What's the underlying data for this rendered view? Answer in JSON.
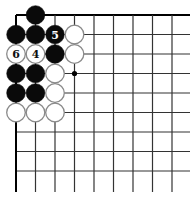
{
  "diagram": {
    "type": "go-board-corner",
    "grid": {
      "cols": 9,
      "rows": 9,
      "origin_x": 16,
      "origin_y": 15,
      "spacing": 19.5,
      "extend_right": 190,
      "extend_bottom": 192,
      "line_color": "#333333",
      "edge_color": "#000000"
    },
    "star_points": [
      {
        "col": 3,
        "row": 3
      }
    ],
    "stones": [
      {
        "col": 1,
        "row": 0,
        "color": "black",
        "label": ""
      },
      {
        "col": 0,
        "row": 1,
        "color": "black",
        "label": ""
      },
      {
        "col": 1,
        "row": 1,
        "color": "black",
        "label": ""
      },
      {
        "col": 2,
        "row": 1,
        "color": "black",
        "label": "5"
      },
      {
        "col": 3,
        "row": 1,
        "color": "white",
        "label": ""
      },
      {
        "col": 0,
        "row": 2,
        "color": "white",
        "label": "6"
      },
      {
        "col": 1,
        "row": 2,
        "color": "white",
        "label": "4"
      },
      {
        "col": 2,
        "row": 2,
        "color": "black",
        "label": ""
      },
      {
        "col": 3,
        "row": 2,
        "color": "white",
        "label": ""
      },
      {
        "col": 0,
        "row": 3,
        "color": "black",
        "label": ""
      },
      {
        "col": 1,
        "row": 3,
        "color": "black",
        "label": ""
      },
      {
        "col": 2,
        "row": 3,
        "color": "white",
        "label": ""
      },
      {
        "col": 0,
        "row": 4,
        "color": "black",
        "label": ""
      },
      {
        "col": 1,
        "row": 4,
        "color": "black",
        "label": ""
      },
      {
        "col": 2,
        "row": 4,
        "color": "white",
        "label": ""
      },
      {
        "col": 0,
        "row": 5,
        "color": "white",
        "label": ""
      },
      {
        "col": 1,
        "row": 5,
        "color": "white",
        "label": ""
      },
      {
        "col": 2,
        "row": 5,
        "color": "white",
        "label": ""
      }
    ],
    "colors": {
      "black_stone": "#0a0a0a",
      "white_stone": "#ffffff",
      "white_outline": "#8a8a8a",
      "label_on_black": "#ffffff",
      "label_on_white": "#111111"
    }
  }
}
